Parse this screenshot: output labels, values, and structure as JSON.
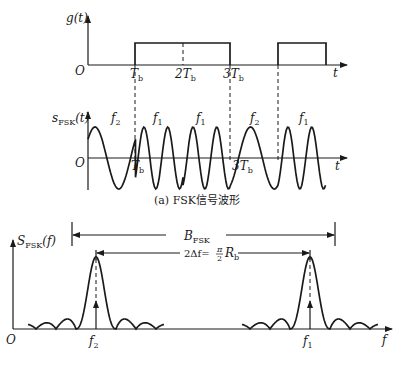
{
  "figure": {
    "top_panel": {
      "ylabel": "g(t)",
      "origin": "O",
      "xlabel": "t",
      "ticks": [
        {
          "label": "T",
          "sub": "b"
        },
        {
          "label": "2T",
          "sub": "b"
        },
        {
          "label": "3T",
          "sub": "b"
        }
      ]
    },
    "middle_panel": {
      "ylabel_main": "s",
      "ylabel_sub": "FSK",
      "ylabel_tail": "(t)",
      "origin": "O",
      "xlabel": "t",
      "segment_labels": [
        {
          "main": "f",
          "sub": "2"
        },
        {
          "main": "f",
          "sub": "1"
        },
        {
          "main": "f",
          "sub": "1"
        },
        {
          "main": "f",
          "sub": "2"
        },
        {
          "main": "f",
          "sub": "1"
        }
      ],
      "tick_tb": {
        "label": "T",
        "sub": "b"
      },
      "tick_3tb": {
        "label": "3T",
        "sub": "b"
      },
      "caption": "(a) FSK信号波形"
    },
    "bottom_panel": {
      "ylabel_main": "S",
      "ylabel_sub": "FSK",
      "ylabel_tail": "(f)",
      "origin": "O",
      "xlabel": "f",
      "bandwidth_main": "B",
      "bandwidth_sub": "FSK",
      "delta_label": "2Δf=",
      "delta_frac_num": "π",
      "delta_frac_den": "2",
      "delta_tail_main": "R",
      "delta_tail_sub": "b",
      "f2": {
        "main": "f",
        "sub": "2"
      },
      "f1": {
        "main": "f",
        "sub": "1"
      }
    }
  },
  "chart_data": {
    "type": "line",
    "panels": [
      {
        "name": "g(t)",
        "kind": "baseband",
        "bits": [
          0,
          1,
          1,
          0,
          1
        ],
        "bit_period": "Tb"
      },
      {
        "name": "s_FSK(t)",
        "kind": "waveform",
        "segments": [
          "f2",
          "f1",
          "f1",
          "f2",
          "f1"
        ],
        "cycles_per_bit": {
          "f1": 2,
          "f2": 1
        }
      },
      {
        "name": "S_FSK(f)",
        "kind": "spectrum",
        "peaks": [
          "f2",
          "f1"
        ],
        "annotations": [
          "B_FSK",
          "2Δf = (π/2) R_b"
        ]
      }
    ]
  }
}
